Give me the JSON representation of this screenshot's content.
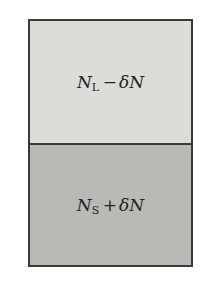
{
  "diagram": {
    "type": "two-compartment box",
    "regions": [
      {
        "position": "top",
        "symbol": "N",
        "subscript": "L",
        "operator": "−",
        "delta": "δN",
        "text": "N_L − δN",
        "fill": "#dcdcd8"
      },
      {
        "position": "bottom",
        "symbol": "N",
        "subscript": "S",
        "operator": "+",
        "delta": "δN",
        "text": "N_S + δN",
        "fill": "#b9b9b6"
      }
    ],
    "border_color": "#3a3a3a"
  }
}
